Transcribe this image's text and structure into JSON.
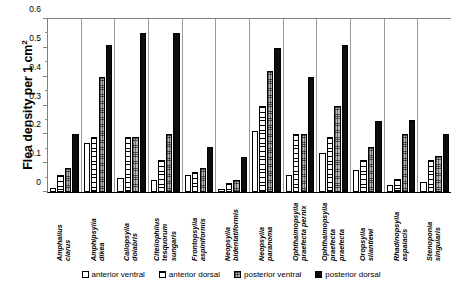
{
  "chart_data": {
    "type": "bar",
    "title": "",
    "xlabel": "",
    "ylabel": "Flea density per 1 cm",
    "ylabel_superscript": "2",
    "ylim": [
      0,
      0.6
    ],
    "yticks": [
      "0",
      "0.1",
      "0.2",
      "0.3",
      "0.4",
      "0.5",
      "0.6"
    ],
    "ytick_values": [
      0,
      0.1,
      0.2,
      0.3,
      0.4,
      0.5,
      0.6
    ],
    "grid": false,
    "legend_position": "bottom",
    "categories": [
      "Amphalius clarus",
      "Amphipsylla dikea",
      "Callopsylla dolabris",
      "Citellophilus tesquorum sungaris",
      "Frontopsylla aspiniformis",
      "Neopsylla bidentatiformis",
      "Neopsylla paranoma",
      "Ophthalmopsylla praefecta pernix",
      "Ophthalmopsylla praefecta praefecta",
      "Oropsylla silantiewi",
      "Rhadinopsylla aspalacis",
      "Stenoponia singularis"
    ],
    "categories_lines": [
      [
        "Amphalius",
        "clarus"
      ],
      [
        "Amphipsylla",
        "dikea"
      ],
      [
        "Callopsylla",
        "dolabris"
      ],
      [
        "Citellophilus",
        "tesquorum",
        "sungaris"
      ],
      [
        "Frontopsylla",
        "aspiniformis"
      ],
      [
        "Neopsylla",
        "bidentatiformis"
      ],
      [
        "Neopsylla",
        "paranoma"
      ],
      [
        "Ophthalmopsylla",
        "praefecta pernix"
      ],
      [
        "Ophthalmopsylla",
        "praefecta",
        "praefecta"
      ],
      [
        "Oropsylla",
        "silantiewi"
      ],
      [
        "Rhadinopsylla",
        "aspalacis"
      ],
      [
        "Stenoponia",
        "singularis"
      ]
    ],
    "series": [
      {
        "name": "anterior ventral",
        "fill": "f-anterior-ventral",
        "color": "#ffffff",
        "values": [
          0.015,
          0.17,
          0.05,
          0.04,
          0.06,
          0.01,
          0.21,
          0.06,
          0.135,
          0.075,
          0.025,
          0.035
        ]
      },
      {
        "name": "anterior dorsal",
        "fill": "f-anterior-dorsal",
        "color": "#ffffff",
        "values": [
          0.06,
          0.19,
          0.19,
          0.11,
          0.07,
          0.03,
          0.3,
          0.2,
          0.19,
          0.11,
          0.045,
          0.11
        ]
      },
      {
        "name": "posterior ventral",
        "fill": "f-posterior-ventral",
        "color": "#b9b9b9",
        "values": [
          0.085,
          0.4,
          0.19,
          0.2,
          0.085,
          0.04,
          0.42,
          0.2,
          0.3,
          0.155,
          0.2,
          0.125
        ]
      },
      {
        "name": "posterior dorsal",
        "fill": "f-posterior-dorsal",
        "color": "#0d0d0d",
        "values": [
          0.2,
          0.51,
          0.55,
          0.55,
          0.155,
          0.12,
          0.5,
          0.4,
          0.51,
          0.245,
          0.25,
          0.2
        ]
      }
    ]
  }
}
